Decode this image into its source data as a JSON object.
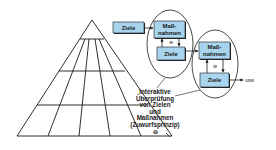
{
  "colors": {
    "box_fill": "#a9d4ee",
    "box_stroke": "#1a1a1a",
    "box_shadow": "#2a2a2a",
    "line": "#1a1a1a",
    "background": "#ffffff"
  },
  "boxes": {
    "ziele_start": {
      "label": "Ziele"
    },
    "massnahmen_1": {
      "label_line1": "Maß-",
      "label_line2": "nahmen"
    },
    "ziele_1": {
      "label": "Ziele"
    },
    "massnahmen_2": {
      "label_line1": "Maß-",
      "label_line2": "nahmen"
    },
    "ziele_2": {
      "label": "Ziele"
    }
  },
  "symbols": {
    "minus_circle": "⊖"
  },
  "continuation_label": "usw",
  "annotation": {
    "lines": [
      "Interaktive",
      "Überprüfung",
      "von Zielen",
      "und",
      "Maßnahmen",
      "(Zuwurfsprinzip)"
    ],
    "symbol": "⊖"
  },
  "pyramid": {
    "levels": 4
  }
}
